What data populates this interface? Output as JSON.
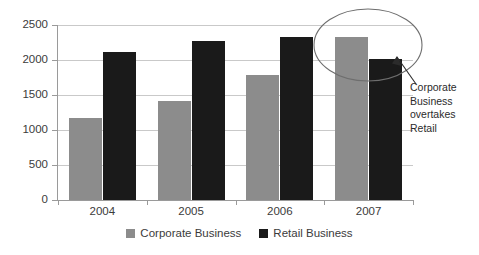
{
  "chart_data": {
    "type": "bar",
    "title": "",
    "subtitle": "",
    "xlabel": "",
    "ylabel": "",
    "categories": [
      "2004",
      "2005",
      "2006",
      "2007"
    ],
    "series": [
      {
        "name": "Corporate Business",
        "color": "#8c8c8c",
        "values": [
          1170,
          1420,
          1780,
          2330
        ]
      },
      {
        "name": "Retail Business",
        "color": "#1a1a1a",
        "values": [
          2110,
          2270,
          2330,
          2010
        ]
      }
    ],
    "ylim": [
      0,
      2500
    ],
    "yticks": [
      0,
      500,
      1000,
      1500,
      2000,
      2500
    ],
    "ytick_labels": [
      "0",
      "500",
      "1000",
      "1500",
      "2000",
      "2500"
    ],
    "grid": true,
    "legend_position": "bottom",
    "annotations": [
      {
        "text": "Corporate Business overtakes Retail",
        "lines": [
          "Corporate",
          "Business",
          "overtakes",
          "Retail"
        ],
        "shape": "ellipse-highlight-with-arrow",
        "target_category": "2007"
      }
    ]
  },
  "legend": {
    "items": [
      {
        "label": "Corporate Business",
        "swatch": "gray-swatch-icon"
      },
      {
        "label": "Retail Business",
        "swatch": "black-swatch-icon"
      }
    ]
  },
  "annotation": {
    "line1": "Corporate",
    "line2": "Business",
    "line3": "overtakes",
    "line4": "Retail"
  }
}
